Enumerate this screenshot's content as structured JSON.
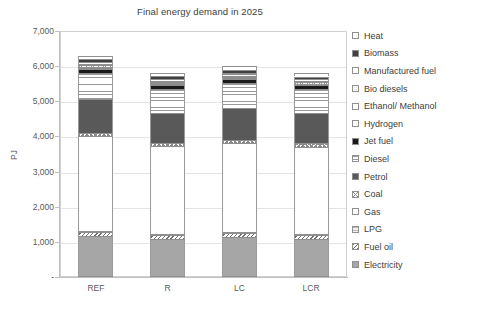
{
  "chart_data": {
    "type": "bar",
    "subtype": "stacked-bar",
    "title": "Final energy demand in 2025",
    "xlabel": "",
    "ylabel": "PJ",
    "categories": [
      "REF",
      "R",
      "LC",
      "LCR"
    ],
    "ylim": [
      0,
      7000
    ],
    "yticks": [
      "-",
      "1,000",
      "2,000",
      "3,000",
      "4,000",
      "5,000",
      "6,000",
      "7,000"
    ],
    "ytick_values": [
      0,
      1000,
      2000,
      3000,
      4000,
      5000,
      6000,
      7000
    ],
    "grid": true,
    "legend_position": "right",
    "stack_order_bottom_to_top": [
      "Electricity",
      "Fuel oil",
      "LPG",
      "Gas",
      "Coal",
      "Petrol",
      "Diesel",
      "Jet fuel",
      "Hydrogen",
      "Ethanol/ Methanol",
      "Bio diesels",
      "Manufactured fuel",
      "Biomass",
      "Heat"
    ],
    "series": [
      {
        "name": "Electricity",
        "swatch": "solid-light",
        "values": [
          1180,
          1080,
          1130,
          1090
        ]
      },
      {
        "name": "Fuel oil",
        "swatch": "diag-hatch-rev",
        "values": [
          90,
          110,
          110,
          105
        ]
      },
      {
        "name": "LPG",
        "swatch": "light-grid",
        "values": [
          40,
          35,
          35,
          35
        ]
      },
      {
        "name": "Gas",
        "swatch": "white",
        "values": [
          2690,
          2500,
          2540,
          2480
        ]
      },
      {
        "name": "Coal",
        "swatch": "checker",
        "values": [
          100,
          90,
          95,
          90
        ]
      },
      {
        "name": "Petrol",
        "swatch": "solid-mid",
        "values": [
          960,
          860,
          900,
          860
        ]
      },
      {
        "name": "Diesel",
        "swatch": "hgrid-wide",
        "values": [
          740,
          680,
          710,
          680
        ]
      },
      {
        "name": "Jet fuel",
        "swatch": "black",
        "values": [
          120,
          110,
          115,
          110
        ]
      },
      {
        "name": "Hydrogen",
        "swatch": "hgrid-fine",
        "values": [
          60,
          55,
          58,
          55
        ]
      },
      {
        "name": "Ethanol/ Methanol",
        "swatch": "vline",
        "values": [
          40,
          35,
          38,
          35
        ]
      },
      {
        "name": "Bio diesels",
        "swatch": "dots",
        "values": [
          35,
          30,
          32,
          30
        ]
      },
      {
        "name": "Manufactured fuel",
        "swatch": "white",
        "values": [
          55,
          50,
          52,
          50
        ]
      },
      {
        "name": "Biomass",
        "swatch": "solid-dark",
        "values": [
          90,
          85,
          88,
          85
        ]
      },
      {
        "name": "Heat",
        "swatch": "white",
        "values": [
          100,
          95,
          97,
          95
        ]
      }
    ],
    "totals": [
      6300,
      5215,
      6100,
      5200
    ]
  },
  "legend": {
    "items": [
      {
        "label": "Heat",
        "swatch": "white"
      },
      {
        "label": "Biomass",
        "swatch": "solid-dark"
      },
      {
        "label": "Manufactured fuel",
        "swatch": "white"
      },
      {
        "label": "Bio diesels",
        "swatch": "dots"
      },
      {
        "label": "Ethanol/ Methanol",
        "swatch": "white"
      },
      {
        "label": "Hydrogen",
        "swatch": "white"
      },
      {
        "label": "Jet fuel",
        "swatch": "black"
      },
      {
        "label": "Diesel",
        "swatch": "hgrid-wide"
      },
      {
        "label": "Petrol",
        "swatch": "solid-mid"
      },
      {
        "label": "Coal",
        "swatch": "checker"
      },
      {
        "label": "Gas",
        "swatch": "white"
      },
      {
        "label": "LPG",
        "swatch": "light-grid"
      },
      {
        "label": "Fuel oil",
        "swatch": "diag-hatch-rev"
      },
      {
        "label": "Electricity",
        "swatch": "solid-light"
      }
    ]
  },
  "colors": {
    "solid_dark": "#404040",
    "solid_mid": "#595959",
    "solid_light": "#a6a6a6",
    "black": "#1a1a1a",
    "white": "#ffffff",
    "gridline": "#e4e4e4",
    "axis": "#bfbfbf",
    "text": "#404040"
  }
}
